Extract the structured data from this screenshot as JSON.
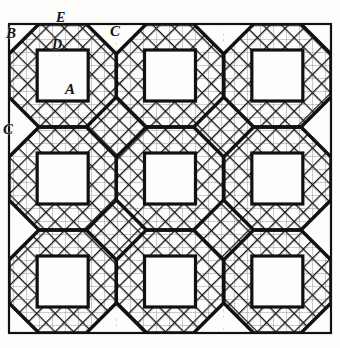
{
  "figure": {
    "ink_color": "#111111",
    "paper_color": "#fdfdfb",
    "hatch_color": "#1a1a1a",
    "frame": {
      "left": 9,
      "top": 24,
      "right": 331,
      "bottom": 333,
      "stroke_width": 2
    },
    "grid": {
      "columns": 3,
      "rows": 3,
      "cell_width": 107.3,
      "cell_height": 103,
      "square_side": 51,
      "octagon_cut": 30
    },
    "hatching": {
      "spacing": 13,
      "stroke_width": 2.6,
      "thin_stroke_width": 0.9
    }
  },
  "labels": [
    {
      "id": "label-b",
      "text": "B",
      "x": 6,
      "y": 26,
      "size": 15
    },
    {
      "id": "label-e",
      "text": "E",
      "x": 56,
      "y": 11,
      "size": 14
    },
    {
      "id": "label-d",
      "text": "D",
      "x": 52,
      "y": 38,
      "size": 14
    },
    {
      "id": "label-c-top",
      "text": "C",
      "x": 110,
      "y": 24,
      "size": 15
    },
    {
      "id": "label-c-left",
      "text": "C",
      "x": 3,
      "y": 122,
      "size": 15
    },
    {
      "id": "label-a",
      "text": "A",
      "x": 65,
      "y": 82,
      "size": 15
    }
  ]
}
